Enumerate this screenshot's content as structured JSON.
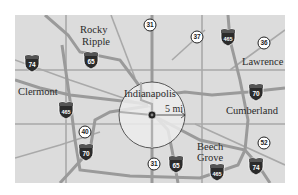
{
  "map": {
    "background_color": "#dcdcdc",
    "road_color": "#9a9a9a",
    "minor_road_color": "#a8a8a8",
    "circle_fill": "#ececec",
    "center": "Indianapolis",
    "radius_label": "5 mi"
  },
  "places": [
    {
      "name": "Rocky",
      "id": "rocky"
    },
    {
      "name": "Ripple",
      "id": "ripple"
    },
    {
      "name": "Lawrence",
      "id": "lawrence"
    },
    {
      "name": "Clermont",
      "id": "clermont"
    },
    {
      "name": "Indianapolis",
      "id": "indianapolis"
    },
    {
      "name": "Cumberland",
      "id": "cumberland"
    },
    {
      "name": "Beech",
      "id": "beech"
    },
    {
      "name": "Grove",
      "id": "grove"
    }
  ],
  "interstates": [
    {
      "number": "74",
      "pos": "west"
    },
    {
      "number": "65",
      "pos": "north"
    },
    {
      "number": "465",
      "pos": "northeast"
    },
    {
      "number": "465",
      "pos": "west"
    },
    {
      "number": "70",
      "pos": "east"
    },
    {
      "number": "70",
      "pos": "southwest"
    },
    {
      "number": "65",
      "pos": "south"
    },
    {
      "number": "465",
      "pos": "south"
    },
    {
      "number": "74",
      "pos": "southeast"
    }
  ],
  "state_routes": [
    {
      "number": "31",
      "pos": "north"
    },
    {
      "number": "37",
      "pos": "north"
    },
    {
      "number": "36",
      "pos": "northeast"
    },
    {
      "number": "40",
      "pos": "west"
    },
    {
      "number": "31",
      "pos": "south"
    },
    {
      "number": "52",
      "pos": "southeast"
    }
  ]
}
